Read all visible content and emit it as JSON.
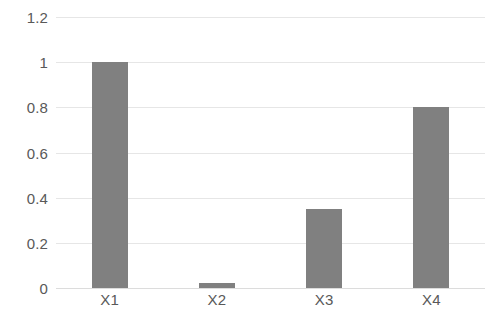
{
  "chart_data": {
    "type": "bar",
    "title": "",
    "subtitle": "",
    "xlabel": "",
    "ylabel": "",
    "categories": [
      "X1",
      "X2",
      "X3",
      "X4"
    ],
    "values": [
      1,
      0.02,
      0.35,
      0.8
    ],
    "ylim": [
      0,
      1.2
    ],
    "yticks": [
      0,
      0.2,
      0.4,
      0.6,
      0.8,
      1,
      1.2
    ],
    "ytick_labels": [
      "0",
      "0.2",
      "0.4",
      "0.6",
      "0.8",
      "1",
      "1.2"
    ],
    "grid": true,
    "grid_axis": "y",
    "legend": false,
    "legend_position": "none",
    "annotations": [],
    "series": [
      {
        "name": "",
        "values": [
          1,
          0.02,
          0.35,
          0.8
        ]
      }
    ]
  },
  "style": {
    "bar_color": "#808080",
    "grid_color": "#E6E6E6",
    "baseline_color": "#DCDCDC",
    "text_color": "#595959",
    "background": "#FFFFFF"
  }
}
